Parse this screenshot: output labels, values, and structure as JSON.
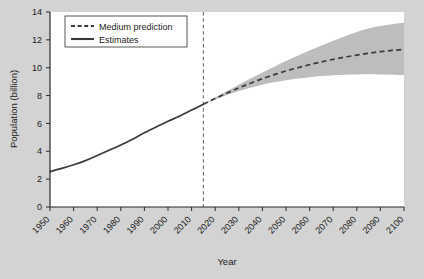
{
  "chart_data": {
    "type": "line",
    "title": "",
    "xlabel": "Year",
    "ylabel": "Population (billion)",
    "xlim": [
      1950,
      2100
    ],
    "ylim": [
      0,
      14
    ],
    "ytick_step": 2,
    "xtick_step": 10,
    "grid": false,
    "legend_position": "upper left",
    "xticks": [
      "1950",
      "1960",
      "1970",
      "1980",
      "1990",
      "2000",
      "2010",
      "2020",
      "2030",
      "2040",
      "2050",
      "2060",
      "2070",
      "2080",
      "2090",
      "2100"
    ],
    "yticks": [
      "0",
      "2",
      "4",
      "6",
      "8",
      "10",
      "12",
      "14"
    ],
    "annotations": [
      {
        "name": "estimate-projection-divider",
        "type": "vline",
        "x": 2015,
        "style": "dashed"
      }
    ],
    "series": [
      {
        "name": "Estimates",
        "style": "solid",
        "color": "#3a3a3a",
        "x": [
          1950,
          1955,
          1960,
          1965,
          1970,
          1975,
          1980,
          1985,
          1990,
          1995,
          2000,
          2005,
          2010,
          2015
        ],
        "values": [
          2.54,
          2.77,
          3.03,
          3.33,
          3.7,
          4.07,
          4.45,
          4.87,
          5.33,
          5.75,
          6.15,
          6.54,
          6.96,
          7.38
        ]
      },
      {
        "name": "Medium prediction",
        "style": "dashed",
        "color": "#3a3a3a",
        "x": [
          2015,
          2020,
          2025,
          2030,
          2035,
          2040,
          2045,
          2050,
          2055,
          2060,
          2065,
          2070,
          2075,
          2080,
          2085,
          2090,
          2095,
          2100
        ],
        "values": [
          7.38,
          7.79,
          8.18,
          8.55,
          8.89,
          9.21,
          9.5,
          9.77,
          10.0,
          10.22,
          10.42,
          10.6,
          10.77,
          10.9,
          11.04,
          11.15,
          11.24,
          11.31
        ]
      }
    ],
    "uncertainty_band": {
      "name": "prediction interval",
      "color": "#b9b9b9",
      "x": [
        2015,
        2020,
        2025,
        2030,
        2035,
        2040,
        2045,
        2050,
        2055,
        2060,
        2065,
        2070,
        2075,
        2080,
        2085,
        2090,
        2095,
        2100
      ],
      "upper": [
        7.38,
        7.86,
        8.32,
        8.78,
        9.22,
        9.66,
        10.07,
        10.48,
        10.86,
        11.24,
        11.59,
        11.94,
        12.26,
        12.57,
        12.82,
        12.99,
        13.12,
        13.22
      ],
      "lower": [
        7.38,
        7.72,
        8.04,
        8.32,
        8.56,
        8.78,
        8.95,
        9.1,
        9.22,
        9.32,
        9.4,
        9.46,
        9.5,
        9.52,
        9.53,
        9.52,
        9.5,
        9.47
      ]
    }
  },
  "legend": {
    "items": [
      {
        "label": "Medium prediction",
        "style": "dashed"
      },
      {
        "label": "Estimates",
        "style": "solid"
      }
    ]
  }
}
